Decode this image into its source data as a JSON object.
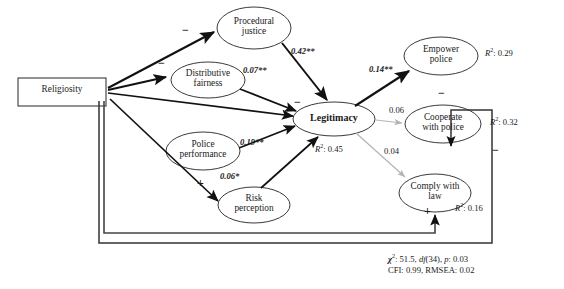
{
  "diagram": {
    "type": "path-diagram",
    "nodes": [
      {
        "id": "religiosity",
        "label": "Religiosity",
        "shape": "rectangle",
        "x": 18,
        "y": 78,
        "w": 88,
        "h": 28
      },
      {
        "id": "procedural_justice",
        "label_line1": "Procedural",
        "label_line2": "justice",
        "shape": "ellipse",
        "cx": 254,
        "cy": 28,
        "rx": 37,
        "ry": 21
      },
      {
        "id": "distributive_fairness",
        "label_line1": "Distributive",
        "label_line2": "fairness",
        "shape": "ellipse",
        "cx": 208,
        "cy": 80,
        "rx": 37,
        "ry": 18
      },
      {
        "id": "police_performance",
        "label_line1": "Police",
        "label_line2": "performance",
        "shape": "ellipse",
        "cx": 203,
        "cy": 151,
        "rx": 37,
        "ry": 19
      },
      {
        "id": "risk_perception",
        "label_line1": "Risk",
        "label_line2": "perception",
        "shape": "ellipse",
        "cx": 254,
        "cy": 205,
        "rx": 36,
        "ry": 18
      },
      {
        "id": "legitimacy",
        "label": "Legitimacy",
        "shape": "ellipse",
        "cx": 334,
        "cy": 119,
        "rx": 41,
        "ry": 17,
        "bold": true
      },
      {
        "id": "empower_police",
        "label_line1": "Empower",
        "label_line2": "police",
        "shape": "ellipse",
        "cx": 441,
        "cy": 56,
        "rx": 37,
        "ry": 19
      },
      {
        "id": "cooperate_with_police",
        "label_line1": "Cooperate",
        "label_line2": "with police",
        "shape": "ellipse",
        "cx": 443,
        "cy": 124,
        "rx": 38,
        "ry": 19
      },
      {
        "id": "comply_with_law",
        "label_line1": "Comply with",
        "label_line2": "law",
        "shape": "ellipse",
        "cx": 435,
        "cy": 193,
        "rx": 36,
        "ry": 19
      }
    ],
    "r_squared": [
      {
        "node": "legitimacy",
        "text": "0.45",
        "x": 315,
        "y": 143
      },
      {
        "node": "empower_police",
        "text": "0.29",
        "x": 485,
        "y": 47
      },
      {
        "node": "cooperate_with_police",
        "text": "0.32",
        "x": 490,
        "y": 116
      },
      {
        "node": "comply_with_law",
        "text": "0.16",
        "x": 455,
        "y": 202
      }
    ],
    "path_labels": [
      {
        "from": "procedural_justice",
        "to": "legitimacy",
        "text": "0.42**",
        "x": 291,
        "y": 47,
        "significant": true
      },
      {
        "from": "distributive_fairness",
        "to": "legitimacy",
        "text": "0.07**",
        "x": 243,
        "y": 66,
        "significant": true
      },
      {
        "from": "police_performance",
        "to": "legitimacy",
        "text": "0.19**",
        "x": 240,
        "y": 138,
        "significant": true
      },
      {
        "from": "risk_perception",
        "to": "legitimacy",
        "text": "0.06*",
        "x": 220,
        "y": 172,
        "significant": true
      },
      {
        "from": "legitimacy",
        "to": "empower_police",
        "text": "0.14**",
        "x": 369,
        "y": 65,
        "significant": true
      },
      {
        "from": "legitimacy",
        "to": "cooperate_with_police",
        "text": "0.06",
        "x": 389,
        "y": 106,
        "significant": false
      },
      {
        "from": "legitimacy",
        "to": "comply_with_law",
        "text": "0.04",
        "x": 384,
        "y": 147,
        "significant": false
      }
    ],
    "sign_labels": [
      {
        "text": "−",
        "x": 182,
        "y": 32,
        "for": "religiosity-to-procedural-justice"
      },
      {
        "text": "−",
        "x": 158,
        "y": 65,
        "for": "religiosity-to-distributive-fairness"
      },
      {
        "text": "−",
        "x": 294,
        "y": 104,
        "for": "religiosity-to-legitimacy"
      },
      {
        "text": "+",
        "x": 197,
        "y": 185,
        "for": "religiosity-to-risk-perception"
      },
      {
        "text": "−",
        "x": 438,
        "y": 95,
        "for": "religiosity-to-cooperate-with-police"
      },
      {
        "text": "+",
        "x": 424,
        "y": 213,
        "for": "religiosity-to-comply-with-law"
      },
      {
        "text": "−",
        "x": 492,
        "y": 152,
        "for": "cooperate-vertical-path"
      }
    ],
    "fit_statistics": {
      "line1_prefix": "χ",
      "line1_sup": "2",
      "line1": ": 51.5, ",
      "line1_df": "df",
      "line1_df_val": "(34), ",
      "line1_p": "p",
      "line1_p_val": ": 0.03",
      "line2": "CFI: 0.99, RMSEA: 0.02",
      "x": 388,
      "y": 253
    },
    "colors": {
      "significant_path": "#111111",
      "nonsignificant_path": "#b4b4b4",
      "node_stroke": "#3a3a3a",
      "text": "#1a1a1a",
      "background": "#ffffff"
    },
    "legend_note": "** p<0.01, * p<0.05; gray paths non-significant"
  }
}
